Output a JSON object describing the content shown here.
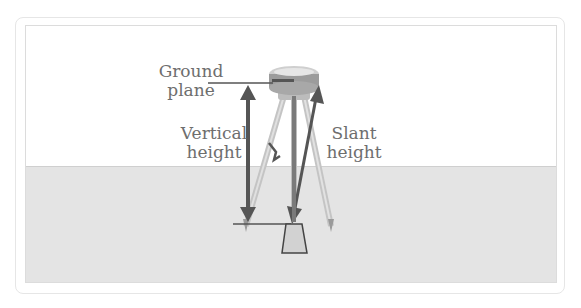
{
  "diagram": {
    "labels": {
      "ground_plane": [
        "Ground",
        "plane"
      ],
      "vertical_height": [
        "Vertical",
        "height"
      ],
      "slant_height": [
        "Slant",
        "height"
      ]
    },
    "colors": {
      "sky": "#ffffff",
      "ground": "#e4e4e4",
      "arrow": "#555555",
      "text": "#6e6e6e",
      "tripod": "#b8b8b8"
    }
  }
}
